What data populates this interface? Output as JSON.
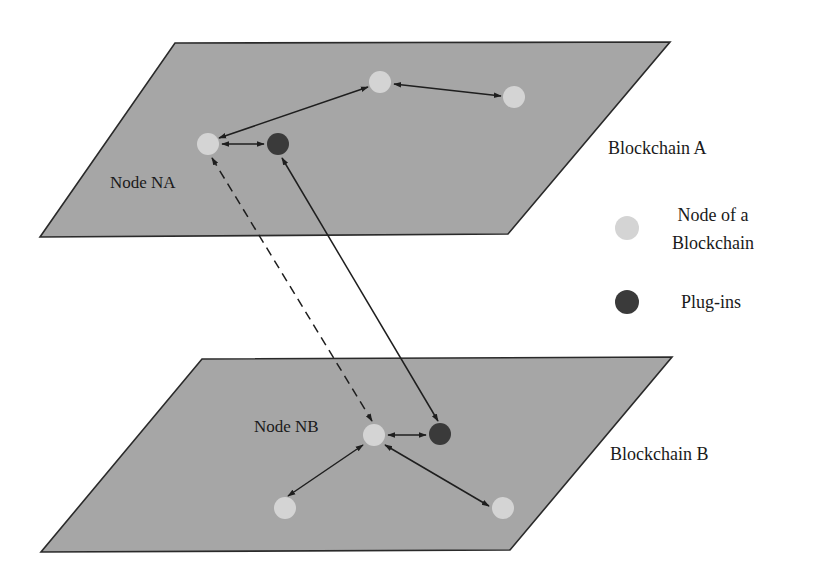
{
  "diagram": {
    "colors": {
      "plane_fill": "#a6a6a6",
      "plane_stroke": "#2a2a2a",
      "node_fill": "#d4d4d4",
      "plugin_fill": "#3a3a3a",
      "line": "#1e1e1e"
    },
    "blockchain_a": {
      "label": "Blockchain A",
      "node_label": "Node NA"
    },
    "blockchain_b": {
      "label": "Blockchain B",
      "node_label": "Node NB"
    },
    "legend": {
      "items": [
        {
          "icon": "node-circle-icon",
          "label_line1": "Node of a",
          "label_line2": "Blockchain"
        },
        {
          "icon": "plugin-circle-icon",
          "label_line1": "Plug-ins"
        }
      ]
    },
    "connections": [
      {
        "from": "Node NA",
        "to": "Node NB",
        "style": "dashed",
        "direction": "both"
      },
      {
        "from": "Plug-in A",
        "to": "Plug-in B",
        "style": "solid",
        "direction": "both"
      }
    ]
  }
}
